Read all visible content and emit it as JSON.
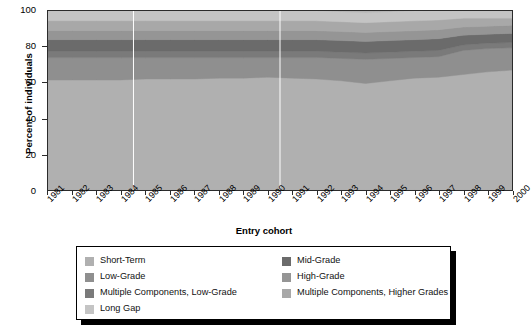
{
  "chart_data": {
    "type": "area",
    "title": "",
    "subtitle": "",
    "xlabel": "Entry cohort",
    "ylabel": "Percent of individuals",
    "stacked": true,
    "stack_total": 100,
    "grid": false,
    "legend_position": "bottom",
    "ylim": [
      0,
      100
    ],
    "yticks": [
      0,
      20,
      40,
      60,
      80,
      100
    ],
    "categories": [
      "1981",
      "1982",
      "1983",
      "1984",
      "1985",
      "1986",
      "1987",
      "1988",
      "1989",
      "1990",
      "1991",
      "1992",
      "1993",
      "1994",
      "1995",
      "1996",
      "1997",
      "1998",
      "1999",
      "2000"
    ],
    "series": [
      {
        "name": "Short-Term",
        "color": "#b0b0b0",
        "values": [
          61.5,
          61.5,
          61.5,
          61.5,
          62.0,
          62.0,
          62.0,
          62.5,
          62.5,
          63.0,
          62.5,
          62.0,
          61.0,
          59.5,
          61.0,
          62.5,
          63.0,
          64.5,
          66.0,
          67.0
        ]
      },
      {
        "name": "Low-Grade",
        "color": "#8f8f8f",
        "values": [
          12.5,
          12.5,
          12.5,
          12.5,
          12.0,
          12.0,
          12.0,
          11.5,
          11.5,
          11.0,
          11.5,
          12.0,
          12.5,
          13.5,
          12.5,
          11.5,
          11.5,
          13.5,
          13.0,
          12.5
        ]
      },
      {
        "name": "Multiple Components, Low-Grade",
        "color": "#7a7a7a",
        "values": [
          3.5,
          3.5,
          3.5,
          3.5,
          3.5,
          3.5,
          3.5,
          3.5,
          3.5,
          3.5,
          3.5,
          3.5,
          3.5,
          3.5,
          3.5,
          3.5,
          3.5,
          3.0,
          3.0,
          3.0
        ]
      },
      {
        "name": "Mid-Grade",
        "color": "#6b6b6b",
        "values": [
          6.5,
          6.5,
          6.5,
          6.5,
          6.5,
          6.5,
          6.5,
          6.5,
          6.5,
          6.5,
          6.5,
          6.5,
          6.5,
          6.5,
          6.5,
          6.5,
          6.5,
          5.5,
          5.0,
          5.0
        ]
      },
      {
        "name": "High-Grade",
        "color": "#959595",
        "values": [
          5.0,
          5.0,
          5.0,
          5.0,
          5.0,
          5.0,
          5.0,
          5.0,
          5.0,
          5.0,
          5.0,
          5.0,
          5.0,
          5.0,
          5.0,
          5.0,
          5.0,
          4.5,
          4.5,
          4.5
        ]
      },
      {
        "name": "Multiple Components, Higher Grades",
        "color": "#a8a8a8",
        "values": [
          5.5,
          5.5,
          5.5,
          5.5,
          5.5,
          5.5,
          5.5,
          5.5,
          5.5,
          5.5,
          5.5,
          5.5,
          5.5,
          5.5,
          5.5,
          5.5,
          5.5,
          5.0,
          4.5,
          4.0
        ]
      },
      {
        "name": "Long Gap",
        "color": "#c4c4c4",
        "values": [
          5.5,
          5.5,
          5.5,
          5.5,
          5.5,
          5.5,
          5.5,
          5.5,
          5.5,
          5.5,
          5.5,
          5.5,
          5.5,
          5.5,
          5.5,
          5.5,
          5.5,
          4.0,
          4.0,
          4.0
        ]
      }
    ]
  },
  "axes": {
    "y_title": "Percent of individuals",
    "x_title": "Entry cohort",
    "y_tick_labels": [
      "0",
      "20",
      "40",
      "60",
      "80",
      "100"
    ],
    "x_tick_labels": [
      "1981",
      "1982",
      "1983",
      "1984",
      "1985",
      "1986",
      "1987",
      "1988",
      "1989",
      "1990",
      "1991",
      "1992",
      "1993",
      "1994",
      "1995",
      "1996",
      "1997",
      "1998",
      "1999",
      "2000"
    ]
  },
  "legend": {
    "left_column": [
      {
        "label": "Short-Term",
        "color": "#b0b0b0"
      },
      {
        "label": "Low-Grade",
        "color": "#8f8f8f"
      },
      {
        "label": "Multiple Components, Low-Grade",
        "color": "#7a7a7a"
      },
      {
        "label": "Long Gap",
        "color": "#c4c4c4"
      }
    ],
    "right_column": [
      {
        "label": "Mid-Grade",
        "color": "#6b6b6b"
      },
      {
        "label": "High-Grade",
        "color": "#959595"
      },
      {
        "label": "Multiple Components, Higher Grades",
        "color": "#a8a8a8"
      }
    ]
  },
  "colors": {
    "plot_border": "#2b2b2b",
    "background": "#ffffff",
    "text": "#000000",
    "legend_border": "#000000",
    "legend_shadow": "#000000",
    "marker_line": "#ffffff"
  }
}
